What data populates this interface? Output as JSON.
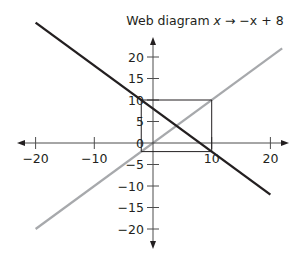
{
  "title": {
    "prefix": "Web diagram ",
    "var": "x",
    "arrow": " → ",
    "rhs": "−x + 8"
  },
  "colors": {
    "axis": "#4d4d4d",
    "function_line": "#231f20",
    "identity_line": "#a7a9ac",
    "web_box": "#231f20"
  },
  "chart_data": {
    "type": "line",
    "title": "Web diagram x → −x + 8",
    "xlabel": "",
    "ylabel": "",
    "xlim": [
      -22,
      23
    ],
    "ylim": [
      -24,
      25
    ],
    "grid": false,
    "x_ticks": [
      -20,
      -10,
      10,
      20
    ],
    "x_tick_labels": [
      "−20",
      "−10",
      "10",
      "20"
    ],
    "y_ticks": [
      -20,
      -15,
      -10,
      -5,
      0,
      5,
      10,
      15,
      20
    ],
    "y_tick_labels": [
      "−20",
      "−15",
      "−10",
      "−5",
      "0",
      "5",
      "10",
      "15",
      "20"
    ],
    "series": [
      {
        "name": "f(x) = −x + 8",
        "color": "#231f20",
        "x": [
          -20,
          20
        ],
        "y": [
          28,
          -12
        ]
      },
      {
        "name": "y = x",
        "color": "#a7a9ac",
        "x": [
          -20,
          22
        ],
        "y": [
          -20,
          22
        ]
      }
    ],
    "web_cycle": {
      "description": "2-cycle box between −2 and 10",
      "corners": [
        [
          -2,
          -2
        ],
        [
          10,
          -2
        ],
        [
          10,
          10
        ],
        [
          -2,
          10
        ]
      ]
    }
  }
}
